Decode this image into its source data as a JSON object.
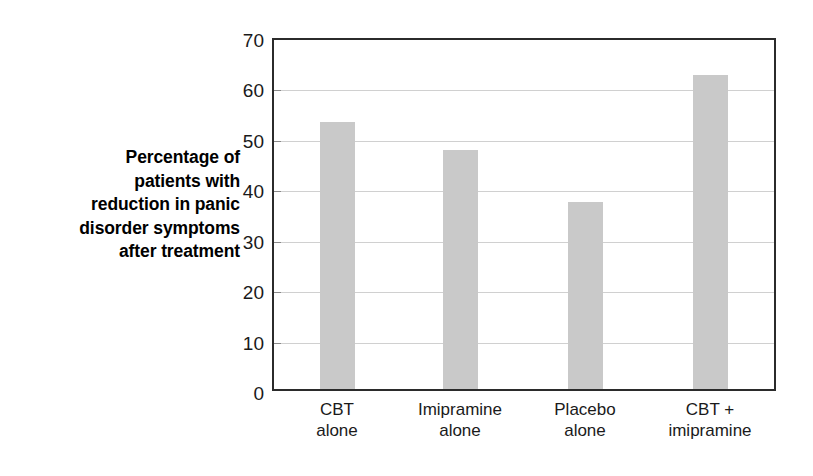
{
  "chart_data": {
    "type": "bar",
    "title": "",
    "subtitle": "",
    "categories": [
      "CBT alone",
      "Imipramine alone",
      "Placebo alone",
      "CBT + imipramine"
    ],
    "category_lines": [
      [
        "CBT",
        "alone"
      ],
      [
        "Imipramine",
        "alone"
      ],
      [
        "Placebo",
        "alone"
      ],
      [
        "CBT +",
        "imipramine"
      ]
    ],
    "values": [
      53.5,
      48,
      37.5,
      63
    ],
    "xlabel": "",
    "ylabel": "Percentage of patients with reduction in panic disorder symptoms after treatment",
    "ylabel_lines": [
      "Percentage of",
      "patients with",
      "reduction in panic",
      "disorder symptoms",
      "after treatment"
    ],
    "ylim": [
      0,
      70
    ],
    "yticks": [
      0,
      10,
      20,
      30,
      40,
      50,
      60,
      70
    ],
    "ytick_labels": [
      "0",
      "10",
      "20",
      "30",
      "40",
      "50",
      "60",
      "70"
    ],
    "grid": true,
    "grid_axis": "y",
    "legend": false,
    "legend_position": "none",
    "colors": {
      "bar_fill": "#c9c9c9",
      "grid": "#d0d0d0",
      "frame": "#2b2b2b",
      "text": "#1a1a1a",
      "background": "#ffffff"
    }
  }
}
